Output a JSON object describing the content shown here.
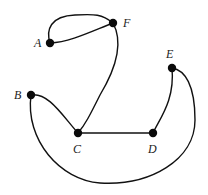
{
  "graph": {
    "nodes": [
      {
        "id": "A",
        "label": "A",
        "x": 50,
        "y": 43
      },
      {
        "id": "F",
        "label": "F",
        "x": 113,
        "y": 23
      },
      {
        "id": "B",
        "label": "B",
        "x": 31,
        "y": 95
      },
      {
        "id": "C",
        "label": "C",
        "x": 78,
        "y": 133
      },
      {
        "id": "D",
        "label": "D",
        "x": 153,
        "y": 133
      },
      {
        "id": "E",
        "label": "E",
        "x": 172,
        "y": 68
      }
    ],
    "edges": [
      {
        "from": "A",
        "to": "F",
        "style": "upper-arc"
      },
      {
        "from": "A",
        "to": "F",
        "style": "lower-arc"
      },
      {
        "from": "F",
        "to": "C"
      },
      {
        "from": "B",
        "to": "C"
      },
      {
        "from": "C",
        "to": "D"
      },
      {
        "from": "D",
        "to": "E"
      },
      {
        "from": "B",
        "to": "E",
        "style": "bottom-arc"
      }
    ],
    "colors": {
      "edge": "#111111",
      "node": "#0a0a0a",
      "label": "#222222",
      "background": "#ffffff"
    }
  }
}
